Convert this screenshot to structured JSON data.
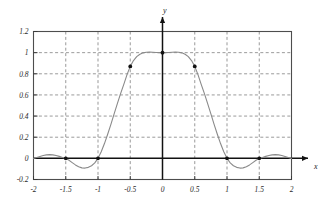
{
  "chart_data": {
    "type": "line",
    "title": "",
    "subtitle": "",
    "xlabel": "x",
    "ylabel": "y",
    "xlim": [
      -2,
      2
    ],
    "ylim": [
      -0.2,
      1.2
    ],
    "grid": true,
    "grid_style": "dashed",
    "legend": null,
    "legend_position": "none",
    "xticks": [
      -2,
      -1.5,
      -1,
      -0.5,
      0,
      0.5,
      1,
      1.5,
      2
    ],
    "xticklabels": [
      "-2",
      "-1.5",
      "-1",
      "-0.5",
      "0",
      "0.5",
      "1",
      "1.5",
      "2"
    ],
    "yticks": [
      -0.2,
      0,
      0.2,
      0.4,
      0.6,
      0.8,
      1,
      1.2
    ],
    "yticklabels": [
      "-0.2",
      "0",
      "0.2",
      "0.4",
      "0.6",
      "0.8",
      "1",
      "1.2"
    ],
    "curve_color": "#8a8a8a",
    "marker_color": "#111111",
    "series": [
      {
        "name": "interpolating-curve",
        "x": [
          -2.0,
          -1.95,
          -1.9,
          -1.85,
          -1.8,
          -1.75,
          -1.7,
          -1.65,
          -1.6,
          -1.55,
          -1.5,
          -1.45,
          -1.4,
          -1.35,
          -1.3,
          -1.25,
          -1.2,
          -1.15,
          -1.1,
          -1.05,
          -1.0,
          -0.95,
          -0.9,
          -0.85,
          -0.8,
          -0.75,
          -0.7,
          -0.65,
          -0.6,
          -0.55,
          -0.5,
          -0.45,
          -0.4,
          -0.35,
          -0.3,
          -0.25,
          -0.2,
          -0.15,
          -0.1,
          -0.05,
          0.0,
          0.05,
          0.1,
          0.15,
          0.2,
          0.25,
          0.3,
          0.35,
          0.4,
          0.45,
          0.5,
          0.55,
          0.6,
          0.65,
          0.7,
          0.75,
          0.8,
          0.85,
          0.9,
          0.95,
          1.0,
          1.05,
          1.1,
          1.15,
          1.2,
          1.25,
          1.3,
          1.35,
          1.4,
          1.45,
          1.5,
          1.55,
          1.6,
          1.65,
          1.7,
          1.75,
          1.8,
          1.85,
          1.9,
          1.95,
          2.0
        ],
        "y": [
          0.0,
          0.008,
          0.018,
          0.027,
          0.033,
          0.035,
          0.033,
          0.027,
          0.019,
          0.009,
          0.0,
          -0.018,
          -0.04,
          -0.062,
          -0.08,
          -0.09,
          -0.092,
          -0.085,
          -0.07,
          -0.043,
          0.0,
          0.062,
          0.14,
          0.228,
          0.322,
          0.42,
          0.518,
          0.612,
          0.7,
          0.792,
          0.87,
          0.925,
          0.962,
          0.985,
          0.998,
          1.004,
          1.006,
          1.004,
          1.001,
          1.0,
          1.0,
          1.0,
          1.001,
          1.004,
          1.006,
          1.004,
          0.998,
          0.985,
          0.962,
          0.925,
          0.87,
          0.792,
          0.7,
          0.612,
          0.518,
          0.42,
          0.322,
          0.228,
          0.14,
          0.062,
          0.0,
          -0.043,
          -0.07,
          -0.085,
          -0.092,
          -0.09,
          -0.08,
          -0.062,
          -0.04,
          -0.018,
          0.0,
          0.009,
          0.019,
          0.027,
          0.033,
          0.035,
          0.033,
          0.027,
          0.018,
          0.008,
          0.0
        ]
      }
    ],
    "markers": [
      {
        "x": -1.5,
        "y": 0.0
      },
      {
        "x": -1.0,
        "y": 0.0
      },
      {
        "x": -0.5,
        "y": 0.87
      },
      {
        "x": 0.0,
        "y": 1.0
      },
      {
        "x": 0.5,
        "y": 0.87
      },
      {
        "x": 1.0,
        "y": 0.0
      },
      {
        "x": 1.5,
        "y": 0.0
      }
    ],
    "annotations": []
  }
}
